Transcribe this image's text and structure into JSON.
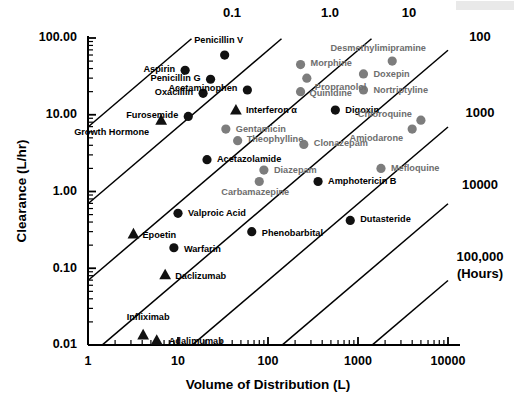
{
  "chart_data": {
    "type": "scatter",
    "title": "",
    "xlabel": "Volume of Distribution (L)",
    "ylabel": "Clearance (L/hr)",
    "xscale": "log",
    "yscale": "log",
    "xlim": [
      1,
      10000
    ],
    "ylim": [
      0.01,
      100
    ],
    "grid": false,
    "legend": "none",
    "xticks": [
      "1",
      "10",
      "100",
      "1000",
      "10000"
    ],
    "xtick_values": [
      1,
      10,
      100,
      1000,
      10000
    ],
    "yticks": [
      "0.01",
      "0.10",
      "1.00",
      "10.00",
      "100.00"
    ],
    "ytick_values": [
      0.01,
      0.1,
      1.0,
      10.0,
      100.0
    ],
    "halflife_lines": {
      "note": "Diagonal iso-half-life lines; t1/2 = 0.693 * Vd / CL (hours)",
      "unit_label": "(Hours)",
      "labels": [
        "0.1",
        "1.0",
        "10",
        "100",
        "1000",
        "10000",
        "100,000"
      ],
      "values": [
        0.1,
        1.0,
        10,
        100,
        1000,
        10000,
        100000
      ]
    },
    "points": [
      {
        "label": "Penicillin V",
        "vd": 33,
        "cl": 60,
        "marker": "circle",
        "color": "black"
      },
      {
        "label": "Aspirin",
        "vd": 12,
        "cl": 38,
        "marker": "circle",
        "color": "black"
      },
      {
        "label": "Penicillin G",
        "vd": 23,
        "cl": 29,
        "marker": "circle",
        "color": "black"
      },
      {
        "label": "Oxacillin",
        "vd": 19,
        "cl": 19,
        "marker": "circle",
        "color": "black"
      },
      {
        "label": "Acetaminophen",
        "vd": 59,
        "cl": 21,
        "marker": "circle",
        "color": "black"
      },
      {
        "label": "Furosemide",
        "vd": 13,
        "cl": 9.5,
        "marker": "circle",
        "color": "black"
      },
      {
        "label": "Growth Hormone",
        "vd": 6.5,
        "cl": 8.5,
        "marker": "triangle",
        "color": "black"
      },
      {
        "label": "Interferon α",
        "vd": 44,
        "cl": 11.5,
        "marker": "triangle",
        "color": "black"
      },
      {
        "label": "Gentamicin",
        "vd": 34,
        "cl": 6.5,
        "marker": "circle",
        "color": "gray"
      },
      {
        "label": "Theophylline",
        "vd": 46,
        "cl": 4.6,
        "marker": "circle",
        "color": "gray"
      },
      {
        "label": "Acetazolamide",
        "vd": 21,
        "cl": 2.6,
        "marker": "circle",
        "color": "black"
      },
      {
        "label": "Desmethylimipramine",
        "vd": 2400,
        "cl": 50,
        "marker": "circle",
        "color": "gray"
      },
      {
        "label": "Morphine",
        "vd": 230,
        "cl": 45,
        "marker": "circle",
        "color": "gray"
      },
      {
        "label": "Doxepin",
        "vd": 1150,
        "cl": 34,
        "marker": "circle",
        "color": "gray"
      },
      {
        "label": "Propranolol",
        "vd": 270,
        "cl": 30,
        "marker": "circle",
        "color": "gray"
      },
      {
        "label": "Nortriptyline",
        "vd": 1150,
        "cl": 21,
        "marker": "circle",
        "color": "gray"
      },
      {
        "label": "Quinidine",
        "vd": 230,
        "cl": 20,
        "marker": "circle",
        "color": "gray"
      },
      {
        "label": "Digoxin",
        "vd": 560,
        "cl": 11.5,
        "marker": "circle",
        "color": "black"
      },
      {
        "label": "Chloroquine",
        "vd": 5000,
        "cl": 8.5,
        "marker": "circle",
        "color": "gray"
      },
      {
        "label": "Amiodarone",
        "vd": 4000,
        "cl": 6.5,
        "marker": "circle",
        "color": "gray"
      },
      {
        "label": "Clonazepam",
        "vd": 250,
        "cl": 4.1,
        "marker": "circle",
        "color": "gray"
      },
      {
        "label": "Mefloquine",
        "vd": 1800,
        "cl": 2.0,
        "marker": "circle",
        "color": "gray"
      },
      {
        "label": "Diazepam",
        "vd": 90,
        "cl": 1.9,
        "marker": "circle",
        "color": "gray"
      },
      {
        "label": "Carbamazepine",
        "vd": 80,
        "cl": 1.35,
        "marker": "circle",
        "color": "gray"
      },
      {
        "label": "Amphotericin B",
        "vd": 360,
        "cl": 1.35,
        "marker": "circle",
        "color": "black"
      },
      {
        "label": "Valproic Acid",
        "vd": 10,
        "cl": 0.52,
        "marker": "circle",
        "color": "black"
      },
      {
        "label": "Dutasteride",
        "vd": 820,
        "cl": 0.42,
        "marker": "circle",
        "color": "black"
      },
      {
        "label": "Epoetin",
        "vd": 3.2,
        "cl": 0.28,
        "marker": "triangle",
        "color": "black"
      },
      {
        "label": "Phenobarbital",
        "vd": 66,
        "cl": 0.3,
        "marker": "circle",
        "color": "black"
      },
      {
        "label": "Warfarin",
        "vd": 9,
        "cl": 0.185,
        "marker": "circle",
        "color": "black"
      },
      {
        "label": "Daclizumab",
        "vd": 7.2,
        "cl": 0.082,
        "marker": "triangle",
        "color": "black"
      },
      {
        "label": "Infliximab",
        "vd": 4.1,
        "cl": 0.0135,
        "marker": "triangle",
        "color": "black"
      },
      {
        "label": "Adalimumab",
        "vd": 5.8,
        "cl": 0.0115,
        "marker": "triangle",
        "color": "black"
      }
    ]
  },
  "axes": {
    "x_title": "Volume of Distribution (L)",
    "y_title": "Clearance (L/hr)",
    "x_tick_labels": [
      "1",
      "10",
      "100",
      "1000",
      "10000"
    ],
    "y_tick_labels": [
      "100.00",
      "10.00",
      "1.00",
      "0.10",
      "0.01"
    ]
  },
  "halflife": {
    "labels_top": [
      "0.1",
      "1.0",
      "10"
    ],
    "labels_right": [
      "100",
      "1000",
      "10000",
      "100,000"
    ],
    "unit": "(Hours)"
  },
  "colors": {
    "marker_black": "#111111",
    "marker_gray": "#7d7d7d",
    "label_black": "#000000",
    "label_gray": "#6e6e6e",
    "axis": "#000000",
    "background": "#ffffff"
  }
}
